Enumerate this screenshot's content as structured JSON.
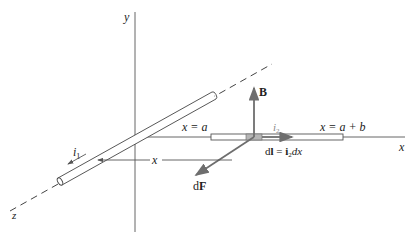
{
  "diagram": {
    "colors": {
      "line": "#555555",
      "vector": "#6e6e6e",
      "element_fill": "#b5b5b5"
    },
    "axes": {
      "x_label": "x",
      "y_label": "y",
      "z_label": "z"
    },
    "wire1": {
      "current_label": "i",
      "current_sub": "1"
    },
    "wire2": {
      "current_label": "i",
      "current_sub": "2",
      "start_label": "x = a",
      "end_label": "x = a + b"
    },
    "distance": {
      "label": "x"
    },
    "vectors": {
      "B": "B",
      "dF_d": "d",
      "dF_F": "F",
      "dl_lhs_d": "d",
      "dl_lhs_l": "l",
      "dl_eq": " = ",
      "dl_i": "i",
      "dl_sub": "2",
      "dl_dx": "dx"
    }
  }
}
